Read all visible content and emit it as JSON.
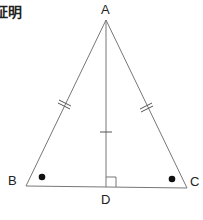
{
  "title": "証明",
  "figure": {
    "type": "isosceles-triangle",
    "labels": {
      "A": "A",
      "B": "B",
      "C": "C",
      "D": "D"
    },
    "points": {
      "A": [
        106,
        20
      ],
      "B": [
        26,
        186
      ],
      "C": [
        187,
        188
      ],
      "D": [
        106,
        187
      ]
    },
    "marks": {
      "AB": "double-tick",
      "AC": "double-tick",
      "AD": "single-tick",
      "angle_B": "dot",
      "angle_C": "dot",
      "angle_ADB": "right-angle"
    },
    "colors": {
      "line": "#777777",
      "mark": "#111111",
      "text": "#222222"
    }
  }
}
